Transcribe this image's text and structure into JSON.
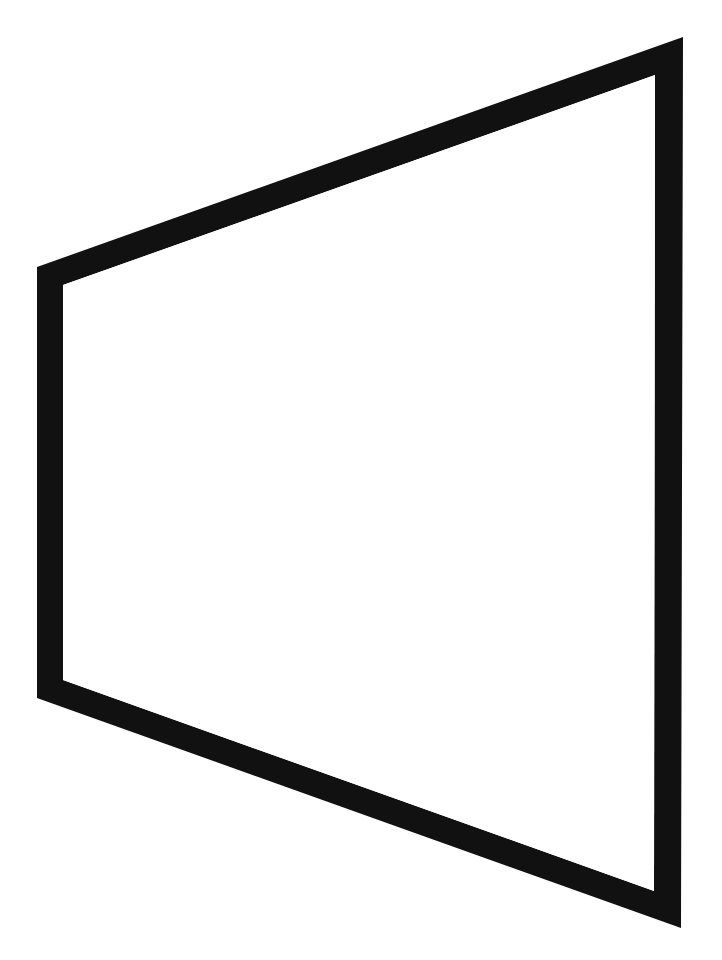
{
  "canvas": {
    "width": 722,
    "height": 960,
    "background": "#ffffff"
  },
  "frame": {
    "shape": "perspective-quadrilateral-frame",
    "color": "#111111",
    "interior_color": "#ffffff",
    "outer_corners": {
      "top_left": [
        37,
        267
      ],
      "top_right": [
        683,
        37
      ],
      "bottom_right": [
        681,
        928
      ],
      "bottom_left": [
        37,
        698
      ]
    },
    "inner_corners": {
      "top_left": [
        63,
        285
      ],
      "top_right": [
        655,
        75
      ],
      "bottom_right": [
        654,
        891
      ],
      "bottom_left": [
        63,
        680
      ]
    }
  }
}
